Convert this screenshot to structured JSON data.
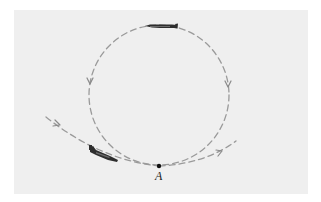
{
  "figure": {
    "point_label": "A",
    "colors": {
      "background": "#efefef",
      "path": "#9a9a9a",
      "plane": "#2e2e2e",
      "point": "#111111"
    },
    "elements": [
      {
        "name": "entry-path",
        "kind": "dashed-curve"
      },
      {
        "name": "loop-circle",
        "kind": "dashed-circle"
      },
      {
        "name": "exit-path",
        "kind": "dashed-curve"
      },
      {
        "name": "airplane-top",
        "kind": "icon",
        "location": "top of loop"
      },
      {
        "name": "airplane-entry",
        "kind": "icon",
        "location": "entry path"
      },
      {
        "name": "point-a",
        "kind": "point",
        "label": "A",
        "location": "bottom of loop"
      }
    ]
  }
}
